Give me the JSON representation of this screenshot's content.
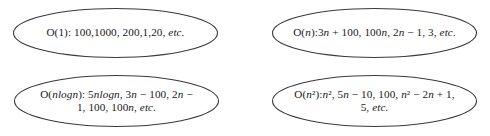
{
  "figure": {
    "type": "diagram",
    "background_color": "#ffffff",
    "stroke_color": "#3a3a3a",
    "text_color": "#1a1a1a"
  },
  "nodes": [
    {
      "id": "o-1",
      "complexity": "O(1)",
      "position": "top-left",
      "lines": [
        "O(1): 100,1000, 200,1,20, etc."
      ],
      "examples": [
        "100",
        "1000",
        "200",
        "1",
        "20",
        "etc."
      ]
    },
    {
      "id": "o-n",
      "complexity": "O(n)",
      "position": "top-right",
      "lines": [
        "O(n):3n + 100,  100n, 2n − 1, 3, etc."
      ],
      "examples": [
        "3n + 100",
        "100n",
        "2n − 1",
        "3",
        "etc."
      ]
    },
    {
      "id": "o-nlogn",
      "complexity": "O(nlogn)",
      "position": "bottom-left",
      "lines": [
        "O(nlogn): 5nlogn, 3n − 100, 2n −",
        "1, 100, 100n, etc."
      ],
      "examples": [
        "5nlogn",
        "3n − 100",
        "2n − 1",
        "100",
        "100n",
        "etc."
      ]
    },
    {
      "id": "o-n2",
      "complexity": "O(n²)",
      "position": "bottom-right",
      "lines": [
        "O(n²):n², 5n − 10, 100, n² − 2n + 1,",
        "5, etc."
      ],
      "examples": [
        "n²",
        "5n − 10",
        "100",
        "n² − 2n + 1",
        "5",
        "etc."
      ]
    }
  ]
}
